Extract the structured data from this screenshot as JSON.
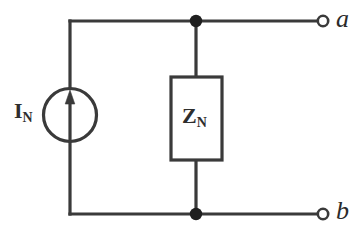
{
  "figure": {
    "background_color": "#ffffff",
    "line_color": "#3a3a3a",
    "label_color": "#2e2e2e"
  },
  "components": {
    "current_source": {
      "symbol_name": "current-source-circle-arrow",
      "label_main": "I",
      "label_sub": "N",
      "arrow_direction": "up"
    },
    "impedance": {
      "symbol_name": "impedance-box",
      "label_main": "Z",
      "label_sub": "N"
    }
  },
  "terminals": [
    {
      "name": "terminal-a",
      "label": "a",
      "position": "top-right",
      "style": "open-circle"
    },
    {
      "name": "terminal-b",
      "label": "b",
      "position": "bottom-right",
      "style": "open-circle"
    }
  ],
  "nodes": [
    {
      "name": "junction-top",
      "style": "filled-dot"
    },
    {
      "name": "junction-bottom",
      "style": "filled-dot"
    }
  ]
}
